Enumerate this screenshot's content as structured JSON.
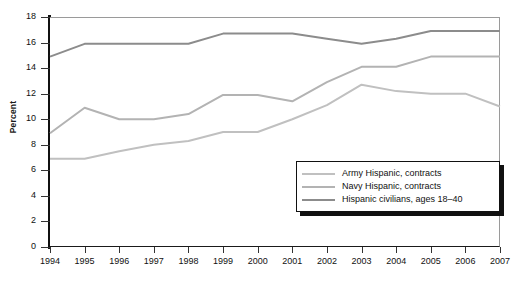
{
  "chart_data": {
    "type": "line",
    "title": "",
    "xlabel": "",
    "ylabel": "Percent",
    "x": [
      1994,
      1995,
      1996,
      1997,
      1998,
      1999,
      2000,
      2001,
      2002,
      2003,
      2004,
      2005,
      2006,
      2007
    ],
    "xtick_labels": [
      "1994",
      "1995",
      "1996",
      "1997",
      "1998",
      "1999",
      "2000",
      "2001",
      "2002",
      "2003",
      "2004",
      "2005",
      "2006",
      "2007"
    ],
    "ytick_labels": [
      "0",
      "2",
      "4",
      "6",
      "8",
      "10",
      "12",
      "14",
      "16",
      "18"
    ],
    "yticks": [
      0,
      2,
      4,
      6,
      8,
      10,
      12,
      14,
      16,
      18
    ],
    "ylim": [
      0,
      18
    ],
    "xlim": [
      1994,
      2007
    ],
    "grid": false,
    "legend_position": "lower-right",
    "series": [
      {
        "name": "Army Hispanic, contracts",
        "color": "#c0c0c0",
        "values": [
          6.9,
          6.9,
          7.5,
          8.0,
          8.3,
          9.0,
          9.0,
          10.0,
          11.1,
          12.7,
          12.2,
          12.0,
          12.0,
          11.0
        ]
      },
      {
        "name": "Navy Hispanic, contracts",
        "color": "#b3b3b3",
        "values": [
          8.9,
          10.9,
          10.0,
          10.0,
          10.4,
          11.9,
          11.9,
          11.4,
          12.9,
          14.1,
          14.1,
          14.9,
          14.9,
          14.9
        ]
      },
      {
        "name": "Hispanic civilians, ages 18–40",
        "color": "#8c8c8c",
        "values": [
          14.9,
          15.9,
          15.9,
          15.9,
          15.9,
          16.7,
          16.7,
          16.7,
          16.3,
          15.9,
          16.3,
          16.9,
          16.9,
          16.9
        ]
      }
    ]
  },
  "legend": {
    "items": [
      "Army Hispanic, contracts",
      "Navy Hispanic, contracts",
      "Hispanic civilians, ages 18–40"
    ]
  },
  "colors": {
    "axis": "#111111",
    "frame": "#9a9a9a",
    "background": "#ffffff",
    "text": "#111111"
  }
}
